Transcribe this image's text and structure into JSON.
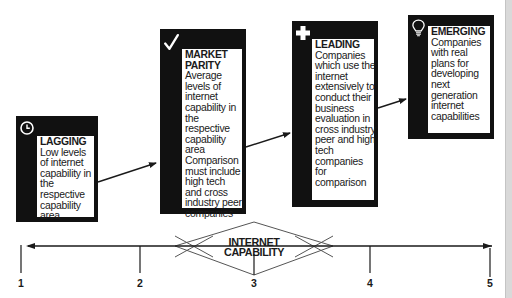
{
  "stages": [
    {
      "id": "lagging",
      "icon": "clock-icon",
      "title": "LAGGING",
      "description": "Low levels of internet capability in the respective capability area"
    },
    {
      "id": "market-parity",
      "icon": "checkmark-icon",
      "title": "MARKET PARITY",
      "description": "Average levels of internet capability in the respective capability area Comparison must include high tech and cross industry peer companies"
    },
    {
      "id": "leading",
      "icon": "plus-icon",
      "title": "LEADING",
      "description": "Companies which use the internet extensively to conduct their business evaluation in cross industry peer and high tech companies for comparison"
    },
    {
      "id": "emerging",
      "icon": "lightbulb-icon",
      "title": "EMERGING",
      "description": "Companies with real plans for developing next generation internet capabilities"
    }
  ],
  "axis": {
    "title_line1": "INTERNET",
    "title_line2": "CAPABILITY",
    "ticks": [
      "1",
      "2",
      "3",
      "4",
      "5"
    ]
  },
  "colors": {
    "box": "#111111",
    "line": "#1a1a1a",
    "diamond": "#555555"
  }
}
